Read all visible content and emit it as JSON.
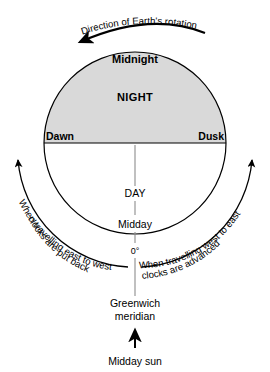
{
  "figure": {
    "title_caption": "Direction of Earth's rotation"
  },
  "rotation": {
    "label": "Direction of Earth's rotation",
    "arrow_direction": "right-to-left",
    "arrow_name": "rotation-arrow"
  },
  "globe": {
    "night_label": "NIGHT",
    "midnight_label": "Midnight",
    "dawn_label": "Dawn",
    "dusk_label": "Dusk",
    "day_label": "DAY",
    "midday_label": "Midday",
    "zero_label": "0°",
    "night_fill": "#d9d9d9",
    "day_fill": "#ffffff",
    "outline": "#000000"
  },
  "travel_west": {
    "line1": "When travelling east to west",
    "line2": "clocks are put back",
    "arrow_direction": "upward",
    "side": "left"
  },
  "travel_east": {
    "line1": "When travelling west to east",
    "line2": "clocks are advanced",
    "arrow_direction": "upward",
    "side": "right"
  },
  "meridian": {
    "line1": "Greenwich",
    "line2": "meridian"
  },
  "sun": {
    "label": "Midday sun",
    "arrow_direction": "upward"
  }
}
